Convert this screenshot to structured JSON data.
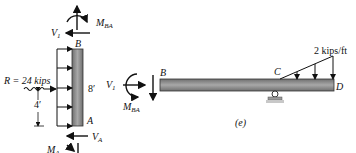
{
  "figure": {
    "caption": "(e)",
    "colors": {
      "member_fill": "#8c8c8c",
      "member_stroke": "#333333",
      "line": "#111111",
      "support": "#9a9a9a"
    }
  },
  "column_fbd": {
    "top_label": "B",
    "bottom_label": "A",
    "length_label": "8′",
    "resultant_label": "R = 24 kips",
    "resultant_height_label": "4′",
    "top_shear_label": "V",
    "top_shear_sub": "1",
    "top_moment_label": "M",
    "top_moment_sub": "BA",
    "bottom_shear_label": "V",
    "bottom_shear_sub": "A",
    "bottom_moment_label": "M",
    "bottom_moment_sub": "A"
  },
  "beam_fbd": {
    "left_label": "B",
    "mid_label": "C",
    "right_label": "D",
    "load_label": "2 kips/ft",
    "left_shear_label": "V",
    "left_shear_sub": "1",
    "left_moment_label": "M",
    "left_moment_sub": "BA"
  }
}
